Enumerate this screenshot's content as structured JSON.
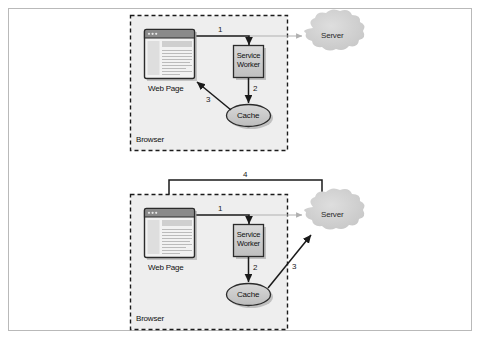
{
  "figure": {
    "background_color": "#ffffff",
    "frame_border_color": "#b9b9b9"
  },
  "colors": {
    "node_fill": "#c8c8c8",
    "node_stroke": "#2b2b2b",
    "cloud_fill": "#d4d4d4",
    "line": "#1a1a1a",
    "faint_line": "#b0b0b0",
    "dashed_boundary": "#1a1a1a",
    "browser_panel_fill": "#eeeeee",
    "webpage_titlebar": "#8a8a8a",
    "webpage_body": "#f2f2f2",
    "shadow": "#9a9a9a"
  },
  "diagrams": [
    {
      "id": "diagram-top",
      "name": "cache-hit-flow",
      "boundary_label": "Browser",
      "nodes": {
        "web_page": "Web Page",
        "service_worker_line1": "Service",
        "service_worker_line2": "Worker",
        "cache": "Cache",
        "server": "Server"
      },
      "arrows": [
        {
          "id": "a1",
          "label": "1",
          "from": "Web Page",
          "to": "Service Worker"
        },
        {
          "id": "a2",
          "label": "2",
          "from": "Service Worker",
          "to": "Cache"
        },
        {
          "id": "a3",
          "label": "3",
          "from": "Cache",
          "to": "Web Page"
        }
      ]
    },
    {
      "id": "diagram-bottom",
      "name": "cache-miss-flow",
      "boundary_label": "Browser",
      "nodes": {
        "web_page": "Web Page",
        "service_worker_line1": "Service",
        "service_worker_line2": "Worker",
        "cache": "Cache",
        "server": "Server"
      },
      "arrows": [
        {
          "id": "b1",
          "label": "1",
          "from": "Web Page",
          "to": "Service Worker"
        },
        {
          "id": "b2",
          "label": "2",
          "from": "Service Worker",
          "to": "Cache"
        },
        {
          "id": "b3",
          "label": "3",
          "from": "Cache",
          "to": "Server"
        },
        {
          "id": "b4",
          "label": "4",
          "from": "Server",
          "to": "Web Page"
        }
      ]
    }
  ]
}
